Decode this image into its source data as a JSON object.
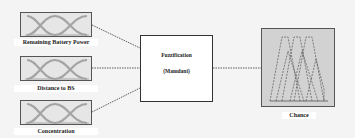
{
  "diagram": {
    "inputs": [
      {
        "label": "Remaining Battery Power",
        "icon": "membership-function-icon"
      },
      {
        "label": "Distance to BS",
        "icon": "membership-function-icon"
      },
      {
        "label": "Concentration",
        "icon": "membership-function-icon"
      }
    ],
    "process": {
      "title": "Fuzzification",
      "subtitle": "(Mamdani)"
    },
    "output": {
      "label": "Chance",
      "icon": "output-membership-functions-icon"
    },
    "colors": {
      "background": "#f4f4f4",
      "box_border": "#555555",
      "input_fill": "#e6e6e6",
      "output_fill": "#d2d2d2",
      "curve": "#9a9a9a",
      "connector": "#333333"
    }
  }
}
